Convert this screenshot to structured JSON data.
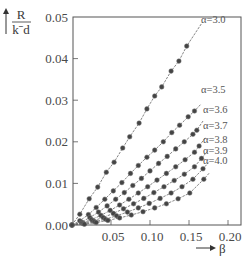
{
  "chart_data": {
    "type": "scatter",
    "title": "",
    "xlabel": "β",
    "ylabel_numerator": "R",
    "ylabel_denominator": "kˉd",
    "xlim": [
      0.0,
      0.217
    ],
    "ylim": [
      0.0,
      0.05
    ],
    "x_ticks": [
      0.05,
      0.1,
      0.15,
      0.2
    ],
    "x_tick_labels": [
      "0.05",
      "0.10",
      "0.15",
      "0.20"
    ],
    "y_ticks": [
      0.0,
      0.01,
      0.02,
      0.03,
      0.04,
      0.05
    ],
    "y_tick_labels": [
      "0.00",
      "0.01",
      "0.02",
      "0.03",
      "0.04",
      "0.05"
    ],
    "grid": false,
    "legend_position": "inline-labels-right",
    "series": [
      {
        "name": "α=3.0",
        "label": "α=3.0",
        "line_end": [
          0.167,
          0.0487
        ],
        "x": [
          0.0,
          0.01,
          0.022,
          0.033,
          0.044,
          0.054,
          0.065,
          0.074,
          0.086,
          0.096,
          0.106,
          0.115,
          0.127,
          0.137,
          0.147
        ],
        "y": [
          0.0,
          0.0026,
          0.0063,
          0.0091,
          0.0127,
          0.0151,
          0.0185,
          0.0212,
          0.0245,
          0.0279,
          0.031,
          0.0332,
          0.037,
          0.0394,
          0.043
        ]
      },
      {
        "name": "α=3.5",
        "label": "α=3.5",
        "line_end": [
          0.165,
          0.029
        ],
        "x": [
          0.0,
          0.01,
          0.021,
          0.031,
          0.042,
          0.053,
          0.064,
          0.075,
          0.085,
          0.096,
          0.106,
          0.117,
          0.128,
          0.138,
          0.149,
          0.157
        ],
        "y": [
          0.0,
          0.001,
          0.0025,
          0.0042,
          0.0062,
          0.0082,
          0.0102,
          0.0124,
          0.0143,
          0.0163,
          0.018,
          0.02,
          0.0222,
          0.024,
          0.026,
          0.0274
        ]
      },
      {
        "name": "α=3.6",
        "label": "α=3.6",
        "line_end": [
          0.168,
          0.025
        ],
        "x": [
          0.0,
          0.012,
          0.023,
          0.034,
          0.045,
          0.056,
          0.067,
          0.078,
          0.089,
          0.1,
          0.111,
          0.122,
          0.133,
          0.144,
          0.155,
          0.16
        ],
        "y": [
          0.0,
          0.0007,
          0.0018,
          0.0031,
          0.0046,
          0.0062,
          0.0078,
          0.0095,
          0.0112,
          0.013,
          0.0148,
          0.0165,
          0.0183,
          0.02,
          0.0218,
          0.0228
        ]
      },
      {
        "name": "α=3.7",
        "label": "α=3.7",
        "line_end": [
          0.171,
          0.021
        ],
        "x": [
          0.0,
          0.013,
          0.025,
          0.037,
          0.049,
          0.061,
          0.073,
          0.085,
          0.097,
          0.109,
          0.121,
          0.133,
          0.145,
          0.157,
          0.163
        ],
        "y": [
          0.0,
          0.0005,
          0.0013,
          0.0023,
          0.0035,
          0.0048,
          0.0062,
          0.0077,
          0.0092,
          0.0108,
          0.0124,
          0.014,
          0.0157,
          0.0175,
          0.019
        ]
      },
      {
        "name": "α=3.8",
        "label": "α=3.8",
        "line_end": [
          0.174,
          0.0178
        ],
        "x": [
          0.0,
          0.014,
          0.027,
          0.04,
          0.053,
          0.066,
          0.079,
          0.092,
          0.105,
          0.118,
          0.131,
          0.144,
          0.157,
          0.166
        ],
        "y": [
          0.0,
          0.0004,
          0.001,
          0.0018,
          0.0028,
          0.0039,
          0.0051,
          0.0064,
          0.0078,
          0.0092,
          0.0107,
          0.0122,
          0.014,
          0.016
        ]
      },
      {
        "name": "α=3.9",
        "label": "α=3.9",
        "line_end": [
          0.175,
          0.015
        ],
        "x": [
          0.0,
          0.015,
          0.029,
          0.043,
          0.057,
          0.071,
          0.085,
          0.099,
          0.113,
          0.127,
          0.141,
          0.155,
          0.168
        ],
        "y": [
          0.0,
          0.0003,
          0.0008,
          0.0014,
          0.0022,
          0.0031,
          0.0041,
          0.0052,
          0.0064,
          0.0077,
          0.0092,
          0.011,
          0.0135
        ]
      },
      {
        "name": "α=4.0",
        "label": "α=4.0",
        "line_end": [
          0.176,
          0.0125
        ],
        "x": [
          0.0,
          0.016,
          0.031,
          0.046,
          0.061,
          0.076,
          0.091,
          0.106,
          0.121,
          0.136,
          0.151,
          0.169
        ],
        "y": [
          0.0,
          0.0002,
          0.0006,
          0.0011,
          0.0017,
          0.0024,
          0.0032,
          0.0041,
          0.0051,
          0.0063,
          0.0077,
          0.011
        ]
      }
    ]
  },
  "axes": {
    "x_title": "β",
    "y_title_num": "R",
    "y_title_den": "kˉd"
  },
  "series_labels": [
    "α=3.0",
    "α=3.5",
    "α=3.6",
    "α=3.7",
    "α=3.8",
    "α=3.9",
    "α=4.0"
  ],
  "colors": {
    "frame": "#555555",
    "line": "#666666",
    "marker": "#444444",
    "text": "#4a4a4a"
  }
}
